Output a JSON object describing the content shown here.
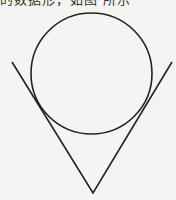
{
  "caption": "的数据形，如图      所示",
  "figure": {
    "stroke_color": "#222222",
    "background": "#f4f4f2",
    "circle": {
      "cx": 91.5,
      "cy": 73.5,
      "r": 60.5
    },
    "v_shape": {
      "left_start": [
        12,
        62
      ],
      "vertex": [
        93,
        193
      ],
      "right_end": [
        172,
        62
      ]
    }
  }
}
